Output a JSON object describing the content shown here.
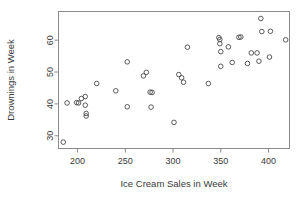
{
  "chart_data": {
    "type": "scatter",
    "title": "",
    "xlabel": "Ice Cream Sales in Week",
    "ylabel": "Drownings in Week",
    "xlim": [
      180,
      422
    ],
    "ylim": [
      26,
      69
    ],
    "xticks": [
      200,
      250,
      300,
      350,
      400
    ],
    "yticks": [
      30,
      40,
      50,
      60
    ],
    "xtick_labels": [
      "200",
      "250",
      "300",
      "350",
      "400"
    ],
    "ytick_labels": [
      "30",
      "40",
      "50",
      "60"
    ],
    "grid": false,
    "legend": null,
    "marker": "open-circle",
    "marker_color": "#4a4a4a",
    "frame_color": "#8a8a8a",
    "points": [
      {
        "x": 185,
        "y": 28.0
      },
      {
        "x": 189,
        "y": 40.3
      },
      {
        "x": 199,
        "y": 40.4
      },
      {
        "x": 201,
        "y": 40.3
      },
      {
        "x": 204,
        "y": 41.7
      },
      {
        "x": 208,
        "y": 42.3
      },
      {
        "x": 208,
        "y": 39.6
      },
      {
        "x": 209,
        "y": 37.0
      },
      {
        "x": 209,
        "y": 36.2
      },
      {
        "x": 220,
        "y": 46.4
      },
      {
        "x": 240,
        "y": 44.1
      },
      {
        "x": 252,
        "y": 53.2
      },
      {
        "x": 252,
        "y": 39.1
      },
      {
        "x": 269,
        "y": 48.8
      },
      {
        "x": 272,
        "y": 49.9
      },
      {
        "x": 276,
        "y": 43.7
      },
      {
        "x": 278,
        "y": 43.6
      },
      {
        "x": 277,
        "y": 39.0
      },
      {
        "x": 301,
        "y": 34.2
      },
      {
        "x": 306,
        "y": 49.2
      },
      {
        "x": 309,
        "y": 48.2
      },
      {
        "x": 311,
        "y": 46.8
      },
      {
        "x": 315,
        "y": 57.8
      },
      {
        "x": 337,
        "y": 46.4
      },
      {
        "x": 348,
        "y": 60.8
      },
      {
        "x": 349,
        "y": 60.2
      },
      {
        "x": 349,
        "y": 58.9
      },
      {
        "x": 350,
        "y": 56.4
      },
      {
        "x": 350,
        "y": 51.8
      },
      {
        "x": 358,
        "y": 57.9
      },
      {
        "x": 362,
        "y": 53.0
      },
      {
        "x": 369,
        "y": 60.9
      },
      {
        "x": 371,
        "y": 61.0
      },
      {
        "x": 378,
        "y": 52.7
      },
      {
        "x": 382,
        "y": 56.0
      },
      {
        "x": 388,
        "y": 56.0
      },
      {
        "x": 390,
        "y": 53.4
      },
      {
        "x": 392,
        "y": 66.8
      },
      {
        "x": 393,
        "y": 62.7
      },
      {
        "x": 401,
        "y": 54.7
      },
      {
        "x": 402,
        "y": 62.8
      },
      {
        "x": 418,
        "y": 60.1
      }
    ]
  },
  "axis": {
    "xlabel": "Ice Cream Sales in Week",
    "ylabel": "Drownings in Week"
  }
}
